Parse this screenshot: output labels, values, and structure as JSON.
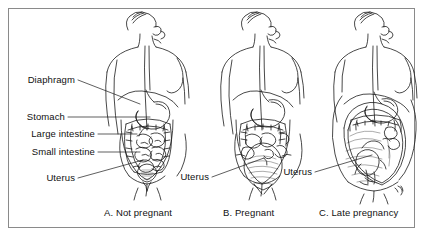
{
  "figure": {
    "background_color": "#ffffff",
    "border_color": "#8a8a8a",
    "ink_color": "#1a1a1a"
  },
  "labels": [
    {
      "id": "diaphragm",
      "text": "Diaphragm"
    },
    {
      "id": "stomach",
      "text": "Stomach"
    },
    {
      "id": "large-intestine",
      "text": "Large intestine"
    },
    {
      "id": "small-intestine",
      "text": "Small intestine"
    },
    {
      "id": "uterus-a",
      "text": "Uterus"
    },
    {
      "id": "uterus-b",
      "text": "Uterus"
    },
    {
      "id": "uterus-c",
      "text": "Uterus"
    }
  ],
  "captions": [
    {
      "id": "panel-a",
      "text": "A. Not pregnant"
    },
    {
      "id": "panel-b",
      "text": "B. Pregnant"
    },
    {
      "id": "panel-c",
      "text": "C. Late pregnancy"
    }
  ]
}
